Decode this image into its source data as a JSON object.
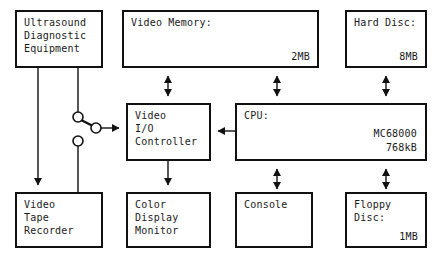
{
  "diagram": {
    "stroke_color": "#111111",
    "background_color": "#ffffff",
    "nodes": [
      {
        "id": "ultrasound",
        "label": "Ultrasound\nDiagnostic\nEquipment",
        "capacity": "",
        "x": 15,
        "y": 10,
        "w": 88,
        "h": 58
      },
      {
        "id": "video-memory",
        "label": "Video Memory:",
        "capacity": "2MB",
        "x": 122,
        "y": 10,
        "w": 197,
        "h": 58
      },
      {
        "id": "hard-disc",
        "label": "Hard Disc:",
        "capacity": "8MB",
        "x": 345,
        "y": 10,
        "w": 82,
        "h": 58
      },
      {
        "id": "video-io-controller",
        "label": "Video\nI/O\nController",
        "capacity": "",
        "x": 126,
        "y": 103,
        "w": 85,
        "h": 58
      },
      {
        "id": "cpu",
        "label": "CPU:",
        "capacity": "",
        "spec": "MC68000\n768kB",
        "x": 235,
        "y": 103,
        "w": 192,
        "h": 58
      },
      {
        "id": "video-tape-recorder",
        "label": "Video\nTape\nRecorder",
        "capacity": "",
        "x": 15,
        "y": 192,
        "w": 88,
        "h": 56
      },
      {
        "id": "color-display-monitor",
        "label": "Color\nDisplay\nMonitor",
        "capacity": "",
        "x": 126,
        "y": 192,
        "w": 85,
        "h": 56
      },
      {
        "id": "console",
        "label": "Console",
        "capacity": "",
        "x": 235,
        "y": 192,
        "w": 78,
        "h": 56
      },
      {
        "id": "floppy-disc",
        "label": "Floppy\nDisc:",
        "capacity": "1MB",
        "x": 345,
        "y": 192,
        "w": 82,
        "h": 56
      }
    ],
    "switch": {
      "name": "selector-switch",
      "terminal_top": {
        "cx": 78,
        "cy": 117,
        "r": 5
      },
      "terminal_bottom": {
        "cx": 78,
        "cy": 141,
        "r": 5
      },
      "common": {
        "cx": 96,
        "cy": 128,
        "r": 5
      },
      "position": "top"
    },
    "connections": [
      {
        "from": "ultrasound",
        "to": "video-tape-recorder",
        "arrows": "single-down"
      },
      {
        "from": "ultrasound",
        "to": "switch-terminal-top",
        "arrows": "none"
      },
      {
        "from": "switch-terminal-bottom",
        "to": "video-tape-recorder",
        "arrows": "none"
      },
      {
        "from": "switch-common",
        "to": "video-io-controller",
        "arrows": "single-right"
      },
      {
        "from": "video-memory",
        "to": "video-io-controller",
        "arrows": "double"
      },
      {
        "from": "video-memory",
        "to": "cpu",
        "arrows": "double"
      },
      {
        "from": "hard-disc",
        "to": "cpu",
        "arrows": "double"
      },
      {
        "from": "cpu",
        "to": "video-io-controller",
        "arrows": "single-left"
      },
      {
        "from": "video-io-controller",
        "to": "color-display-monitor",
        "arrows": "single-down"
      },
      {
        "from": "cpu",
        "to": "console",
        "arrows": "double"
      },
      {
        "from": "cpu",
        "to": "floppy-disc",
        "arrows": "double"
      }
    ]
  }
}
